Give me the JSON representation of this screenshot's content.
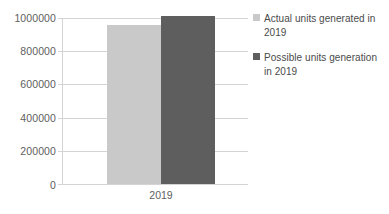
{
  "chart_data": {
    "type": "bar",
    "title": "",
    "xlabel": "",
    "ylabel": "",
    "categories": [
      "2019"
    ],
    "series": [
      {
        "name": "Actual units generated in 2019",
        "values": [
          960000
        ],
        "color": "#c9c9c9"
      },
      {
        "name": "Possible units generation in 2019",
        "values": [
          1015000
        ],
        "color": "#5e5e5e"
      }
    ],
    "ylim": [
      0,
      1000000
    ],
    "yticks": [
      0,
      200000,
      400000,
      600000,
      800000,
      1000000
    ],
    "ytick_labels": [
      "0",
      "200000",
      "400000",
      "600000",
      "800000",
      "1000000"
    ],
    "xtick_labels": [
      "2019"
    ],
    "grid": true,
    "legend_position": "right"
  },
  "axis": {
    "y_ticks": [
      {
        "label": "1000000",
        "value": 1000000
      },
      {
        "label": "800000",
        "value": 800000
      },
      {
        "label": "600000",
        "value": 600000
      },
      {
        "label": "400000",
        "value": 400000
      },
      {
        "label": "200000",
        "value": 200000
      },
      {
        "label": "0",
        "value": 0
      }
    ],
    "x_category": "2019"
  },
  "legend": {
    "items": [
      {
        "label": "Actual units generated in 2019",
        "color": "#c9c9c9"
      },
      {
        "label": "Possible units generation in 2019",
        "color": "#5e5e5e"
      }
    ]
  },
  "colors": {
    "grid": "#d4d4d4",
    "axis_text": "#606060",
    "legend_text": "#4a4a4a",
    "background": "#ffffff"
  }
}
